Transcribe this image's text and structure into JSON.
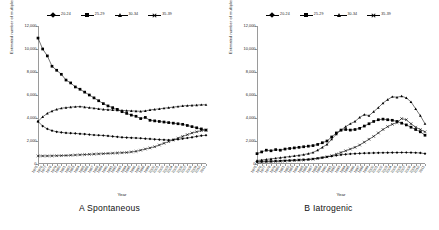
{
  "figure": {
    "panels": [
      {
        "id": "A",
        "caption": "A  Spontaneous",
        "xlabel": "Year",
        "ylabel": "Estimated number of multiples"
      },
      {
        "id": "B",
        "caption": "B  Iatrogenic",
        "xlabel": "Year",
        "ylabel": "Estimated number of multiples"
      }
    ],
    "legend": [
      {
        "label": "20-24",
        "marker": "diamond-icon"
      },
      {
        "label": "25-29",
        "marker": "square-icon"
      },
      {
        "label": "30-34",
        "marker": "triangle-icon"
      },
      {
        "label": "35-39",
        "marker": "cross-icon"
      }
    ]
  },
  "chart_data": [
    {
      "type": "line",
      "title": "A  Spontaneous",
      "xlabel": "Year",
      "ylabel": "Estimated number of multiples",
      "ylim": [
        0,
        12000
      ],
      "yticks": [
        "0",
        "2,000",
        "4,000",
        "6,000",
        "8,000",
        "10,000",
        "12,000"
      ],
      "ytickvalues": [
        0,
        2000,
        4000,
        6000,
        8000,
        10000,
        12000
      ],
      "grid": false,
      "legend_position": "top-center",
      "x": [
        1975,
        1976,
        1977,
        1978,
        1979,
        1980,
        1981,
        1982,
        1983,
        1984,
        1985,
        1986,
        1987,
        1988,
        1989,
        1990,
        1991,
        1992,
        1993,
        1994,
        1995,
        1996,
        1997,
        1998,
        1999,
        2000,
        2001,
        2002,
        2003,
        2004,
        2005,
        2006,
        2007,
        2008,
        2009,
        2010,
        2011
      ],
      "xticklabels": [
        "1975",
        "1976",
        "1977",
        "1978",
        "1979",
        "1980",
        "1981",
        "1982",
        "1983",
        "1984",
        "1985",
        "1986",
        "1987",
        "1988",
        "1989",
        "1990",
        "1991",
        "1992",
        "1993",
        "1994",
        "1995",
        "1996",
        "1997",
        "1998",
        "1999",
        "2000",
        "2001",
        "2002",
        "2003",
        "2004",
        "2005",
        "2006",
        "2007",
        "2008",
        "2009",
        "2010",
        "2011"
      ],
      "series": [
        {
          "name": "20-24",
          "marker": "diamond-icon",
          "values": [
            3700,
            3300,
            3050,
            2900,
            2800,
            2750,
            2700,
            2680,
            2660,
            2620,
            2600,
            2560,
            2520,
            2500,
            2480,
            2440,
            2400,
            2360,
            2320,
            2300,
            2280,
            2260,
            2240,
            2200,
            2180,
            2150,
            2120,
            2100,
            2080,
            2100,
            2150,
            2200,
            2260,
            2320,
            2400,
            2460,
            2500
          ]
        },
        {
          "name": "25-29",
          "marker": "square-icon",
          "values": [
            10950,
            10000,
            9400,
            8500,
            8150,
            7800,
            7300,
            7050,
            6700,
            6500,
            6250,
            6000,
            5750,
            5500,
            5250,
            5050,
            4900,
            4750,
            4550,
            4400,
            4250,
            4150,
            3950,
            4050,
            3800,
            3750,
            3700,
            3650,
            3600,
            3550,
            3500,
            3450,
            3350,
            3250,
            3150,
            3050,
            2950
          ]
        },
        {
          "name": "30-34",
          "marker": "triangle-icon",
          "values": [
            3700,
            4100,
            4400,
            4600,
            4750,
            4850,
            4900,
            4950,
            4980,
            5000,
            4950,
            4900,
            4850,
            4800,
            4750,
            4720,
            4700,
            4680,
            4660,
            4640,
            4620,
            4600,
            4580,
            4620,
            4700,
            4750,
            4800,
            4850,
            4900,
            4950,
            5000,
            5050,
            5080,
            5100,
            5120,
            5150,
            5150
          ]
        },
        {
          "name": "35-39",
          "marker": "cross-icon",
          "values": [
            700,
            700,
            700,
            710,
            720,
            730,
            740,
            760,
            780,
            800,
            820,
            840,
            860,
            880,
            900,
            920,
            940,
            960,
            980,
            1000,
            1050,
            1100,
            1200,
            1300,
            1400,
            1500,
            1650,
            1800,
            1950,
            2100,
            2250,
            2400,
            2550,
            2700,
            2800,
            2900,
            2950
          ]
        }
      ]
    },
    {
      "type": "line",
      "title": "B  Iatrogenic",
      "xlabel": "Year",
      "ylabel": "Estimated number of multiples",
      "ylim": [
        0,
        12000
      ],
      "yticks": [
        "0",
        "2,000",
        "4,000",
        "6,000",
        "8,000",
        "10,000",
        "12,000"
      ],
      "ytickvalues": [
        0,
        2000,
        4000,
        6000,
        8000,
        10000,
        12000
      ],
      "grid": false,
      "legend_position": "top-center",
      "x": [
        1975,
        1976,
        1977,
        1978,
        1979,
        1980,
        1981,
        1982,
        1983,
        1984,
        1985,
        1986,
        1987,
        1988,
        1989,
        1990,
        1991,
        1992,
        1993,
        1994,
        1995,
        1996,
        1997,
        1998,
        1999,
        2000,
        2001,
        2002,
        2003,
        2004,
        2005,
        2006,
        2007,
        2008,
        2009,
        2010,
        2011
      ],
      "xticklabels": [
        "1975",
        "1976",
        "1977",
        "1978",
        "1979",
        "1980",
        "1981",
        "1982",
        "1983",
        "1984",
        "1985",
        "1986",
        "1987",
        "1988",
        "1989",
        "1990",
        "1991",
        "1992",
        "1993",
        "1994",
        "1995",
        "1996",
        "1997",
        "1998",
        "1999",
        "2000",
        "2001",
        "2002",
        "2003",
        "2004",
        "2005",
        "2006",
        "2007",
        "2008",
        "2009",
        "2010",
        "2011"
      ],
      "series": [
        {
          "name": "20-24",
          "marker": "diamond-icon",
          "values": [
            200,
            220,
            240,
            250,
            260,
            280,
            300,
            320,
            340,
            360,
            380,
            400,
            450,
            500,
            560,
            620,
            680,
            740,
            800,
            840,
            880,
            900,
            920,
            940,
            950,
            960,
            970,
            980,
            985,
            990,
            995,
            1000,
            1000,
            990,
            980,
            960,
            900
          ]
        },
        {
          "name": "25-29",
          "marker": "square-icon",
          "values": [
            900,
            1050,
            1200,
            1150,
            1250,
            1200,
            1300,
            1350,
            1400,
            1450,
            1500,
            1550,
            1600,
            1700,
            1850,
            2000,
            2350,
            2700,
            2950,
            3000,
            2950,
            3000,
            3100,
            3300,
            3500,
            3700,
            3850,
            3900,
            3850,
            3800,
            3700,
            3550,
            3400,
            3200,
            3000,
            2800,
            2500
          ]
        },
        {
          "name": "30-34",
          "marker": "triangle-icon",
          "values": [
            300,
            350,
            400,
            450,
            500,
            550,
            600,
            650,
            700,
            750,
            820,
            900,
            1000,
            1200,
            1450,
            1700,
            2150,
            2600,
            2950,
            3250,
            3500,
            3700,
            4050,
            4300,
            4200,
            4550,
            4900,
            5300,
            5600,
            5850,
            5800,
            5900,
            5750,
            5400,
            4800,
            4200,
            3500
          ]
        },
        {
          "name": "35-39",
          "marker": "cross-icon",
          "values": [
            150,
            170,
            190,
            200,
            220,
            240,
            260,
            280,
            300,
            320,
            350,
            380,
            420,
            480,
            550,
            620,
            720,
            850,
            1000,
            1150,
            1300,
            1450,
            1650,
            1900,
            2150,
            2400,
            2700,
            3000,
            3250,
            3450,
            3600,
            3950,
            3850,
            3500,
            3200,
            3000,
            2800
          ]
        }
      ]
    }
  ]
}
